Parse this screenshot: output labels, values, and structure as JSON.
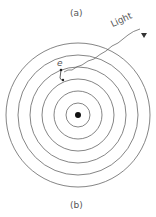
{
  "figure": {
    "top_label": "(a)",
    "bottom_label": "(b)",
    "light_label": "Light",
    "electron_label": "e",
    "colors": {
      "line": "#555555",
      "nucleus": "#111111"
    },
    "rings": [
      12,
      24,
      36,
      48,
      60,
      72
    ]
  }
}
